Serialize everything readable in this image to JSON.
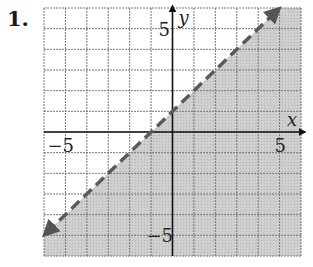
{
  "problem": {
    "label": "1."
  },
  "chart_data": {
    "type": "line",
    "title": "",
    "xlabel": "x",
    "ylabel": "y",
    "xlim": [
      -6,
      6
    ],
    "ylim": [
      -6,
      6
    ],
    "grid": true,
    "grid_step": 1,
    "tick_labels": {
      "x": [
        {
          "value": -5,
          "label": "−5"
        },
        {
          "value": 5,
          "label": "5"
        }
      ],
      "y": [
        {
          "value": 5,
          "label": "5"
        },
        {
          "value": -5,
          "label": "−5"
        }
      ]
    },
    "series": [
      {
        "name": "boundary",
        "equation": "y = x + 1",
        "style": "dashed",
        "arrows": "both",
        "x": [
          -6,
          5
        ],
        "y": [
          -5,
          6
        ]
      }
    ],
    "shaded_region": "below",
    "inequality": "y < x + 1",
    "colors": {
      "shade": "#c8c8c8",
      "grid": "#777777",
      "line": "#5a5a5a",
      "axis": "#111111"
    }
  }
}
